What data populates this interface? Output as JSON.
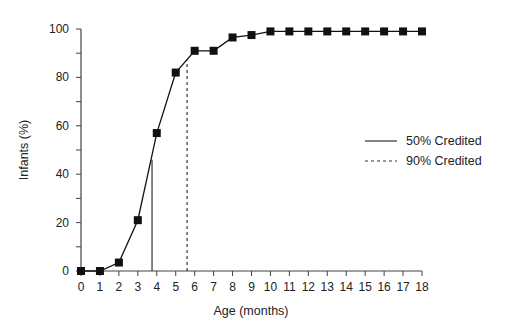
{
  "chart_data": {
    "type": "line",
    "title": "",
    "xlabel": "Age (months)",
    "ylabel": "Infants (%)",
    "xlim": [
      0,
      18
    ],
    "ylim": [
      0,
      100
    ],
    "x_ticks": [
      0,
      1,
      2,
      3,
      4,
      5,
      6,
      7,
      8,
      9,
      10,
      11,
      12,
      13,
      14,
      15,
      16,
      17,
      18
    ],
    "y_ticks": [
      0,
      20,
      40,
      60,
      80,
      100
    ],
    "y_minor_ticks": [
      10,
      30,
      50,
      70,
      90
    ],
    "grid": false,
    "series": [
      {
        "name": "Cumulative infants credited",
        "marker": "square",
        "x": [
          0,
          1,
          2,
          3,
          4,
          5,
          6,
          7,
          8,
          9,
          10,
          11,
          12,
          13,
          14,
          15,
          16,
          17,
          18
        ],
        "values": [
          0,
          0,
          3.5,
          21,
          57,
          82,
          91,
          91,
          96.5,
          97.5,
          99,
          99,
          99,
          99,
          99,
          99,
          99,
          99,
          99
        ]
      }
    ],
    "reference_lines": [
      {
        "name": "50% Credited",
        "style": "solid",
        "x": 3.75,
        "y_top": 46
      },
      {
        "name": "90% Credited",
        "style": "dashed",
        "x": 5.6,
        "y_top": 87
      }
    ],
    "legend": {
      "position": "right-middle",
      "entries": [
        {
          "label": "50% Credited",
          "style": "solid"
        },
        {
          "label": "90% Credited",
          "style": "dashed"
        }
      ]
    }
  }
}
